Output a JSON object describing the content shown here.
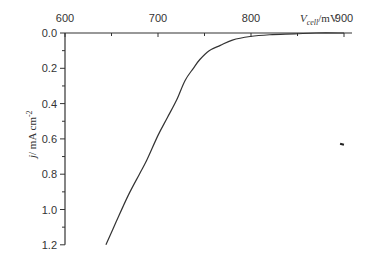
{
  "chart_data": {
    "type": "line",
    "title": "",
    "xlabel": "V_cell/mV",
    "xlabel_parts": {
      "symbol": "V",
      "subscript": "cell",
      "unit": "/mV"
    },
    "ylabel": "j/ mA cm^-2",
    "ylabel_parts": {
      "symbol": "j",
      "unit": "/ mA cm",
      "superscript": "-2"
    },
    "xlim": [
      600,
      910
    ],
    "ylim": [
      0.0,
      1.2
    ],
    "y_inverted": true,
    "x_axis_position": "top",
    "grid": false,
    "legend": null,
    "x_ticks": [
      "600",
      "700",
      "800",
      "900"
    ],
    "y_ticks": [
      "0.0",
      "0.2",
      "0.4",
      "0.6",
      "0.8",
      "1.0",
      "1.2"
    ],
    "series": [
      {
        "name": "j-V curve",
        "color": "#333333",
        "x": [
          644,
          655,
          668,
          680,
          688,
          700,
          710,
          720,
          729,
          738,
          745,
          755,
          767,
          780,
          799,
          820,
          847,
          870,
          900
        ],
        "y": [
          1.2,
          1.07,
          0.92,
          0.8,
          0.72,
          0.58,
          0.48,
          0.38,
          0.27,
          0.2,
          0.15,
          0.1,
          0.07,
          0.04,
          0.02,
          0.01,
          0.005,
          0.0,
          0.0
        ]
      }
    ],
    "annotations": [
      {
        "type": "mark",
        "x": 900,
        "y": 0.63,
        "color": "#222222"
      }
    ]
  }
}
